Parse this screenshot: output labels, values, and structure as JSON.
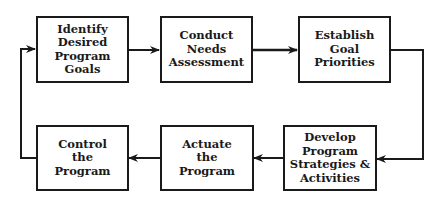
{
  "diagram": {
    "type": "flowchart-cycle",
    "nodes": [
      {
        "id": "identify",
        "label": "Identify\nDesired\nProgram Goals"
      },
      {
        "id": "conduct",
        "label": "Conduct\nNeeds\nAssessment"
      },
      {
        "id": "establish",
        "label": "Establish\nGoal\nPriorities"
      },
      {
        "id": "develop",
        "label": "Develop\nProgram\nStrategies &\nActivities"
      },
      {
        "id": "actuate",
        "label": "Actuate\nthe\nProgram"
      },
      {
        "id": "control",
        "label": "Control\nthe\nProgram"
      }
    ],
    "edges": [
      {
        "from": "identify",
        "to": "conduct"
      },
      {
        "from": "conduct",
        "to": "establish"
      },
      {
        "from": "establish",
        "to": "develop"
      },
      {
        "from": "develop",
        "to": "actuate"
      },
      {
        "from": "actuate",
        "to": "control"
      },
      {
        "from": "control",
        "to": "identify"
      }
    ],
    "colors": {
      "stroke": "#1a1a1a",
      "background": "#ffffff"
    }
  }
}
